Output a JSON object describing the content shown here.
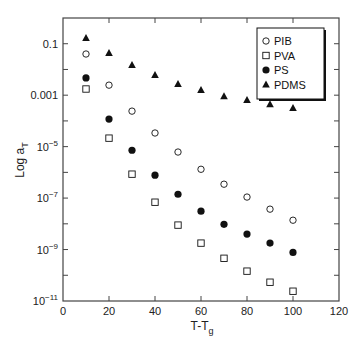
{
  "chart_data": {
    "type": "scatter",
    "title": "",
    "xlabel": "T-T",
    "xlabel_sub": "g",
    "ylabel": "Log a",
    "ylabel_sub": "T",
    "xlim": [
      0,
      120
    ],
    "ylim_log10": [
      -11,
      0
    ],
    "yscale": "log",
    "grid": false,
    "legend_position": "upper right",
    "x_ticks": [
      0,
      20,
      40,
      60,
      80,
      100,
      120
    ],
    "y_ticks": [
      {
        "exp": -1,
        "label": "0.1"
      },
      {
        "exp": -3,
        "label": "0.001"
      },
      {
        "exp": -5,
        "label": "10",
        "sup": "−5"
      },
      {
        "exp": -7,
        "label": "10",
        "sup": "−7"
      },
      {
        "exp": -9,
        "label": "10",
        "sup": "−9"
      },
      {
        "exp": -11,
        "label": "10",
        "sup": "−11"
      }
    ],
    "y_minor_ticks_exp": [
      -2,
      -4,
      -6,
      -8,
      -10
    ],
    "x": [
      10,
      20,
      30,
      40,
      50,
      60,
      70,
      80,
      90,
      100
    ],
    "series": [
      {
        "name": "PIB",
        "marker": "open-circle",
        "log10_values": [
          -1.4,
          -2.61,
          -3.62,
          -4.47,
          -5.21,
          -5.88,
          -6.46,
          -6.96,
          -7.43,
          -7.86
        ]
      },
      {
        "name": "PVA",
        "marker": "open-square",
        "log10_values": [
          -2.76,
          -4.67,
          -6.07,
          -7.16,
          -8.05,
          -8.75,
          -9.34,
          -9.84,
          -10.27,
          -10.62
        ]
      },
      {
        "name": "PS",
        "marker": "filled-circle",
        "log10_values": [
          -2.33,
          -3.93,
          -5.14,
          -6.11,
          -6.85,
          -7.51,
          -8.02,
          -8.4,
          -8.75,
          -9.11
        ]
      },
      {
        "name": "PDMS",
        "marker": "filled-triangle",
        "log10_values": [
          -0.78,
          -1.36,
          -1.83,
          -2.22,
          -2.57,
          -2.8,
          -3.04,
          -3.19,
          -3.35,
          -3.5
        ]
      }
    ]
  },
  "colors": {
    "axis": "#444444",
    "marker": "#111111",
    "background": "#ffffff"
  }
}
